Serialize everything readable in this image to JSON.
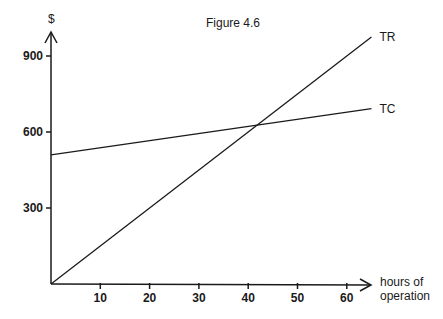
{
  "chart_data": {
    "type": "line",
    "title": "Figure 4.6",
    "xlabel": "hours of operation",
    "xlabel_lines": [
      "hours of",
      "operation"
    ],
    "ylabel": "$",
    "xlim": [
      0,
      65
    ],
    "ylim": [
      0,
      1000
    ],
    "x_ticks": [
      10,
      20,
      30,
      40,
      50,
      60
    ],
    "x_tick_labels": [
      "10",
      "20",
      "30",
      "40",
      "50",
      "60"
    ],
    "y_ticks": [
      300,
      600,
      900
    ],
    "y_tick_labels": [
      "300",
      "600",
      "900"
    ],
    "grid": false,
    "legend": "inline labels at line ends",
    "series": [
      {
        "name": "TR",
        "x": [
          0,
          65
        ],
        "values": [
          0,
          975
        ]
      },
      {
        "name": "TC",
        "x": [
          0,
          65
        ],
        "values": [
          510,
          692
        ]
      }
    ],
    "annotations": [
      "TR",
      "TC"
    ]
  }
}
